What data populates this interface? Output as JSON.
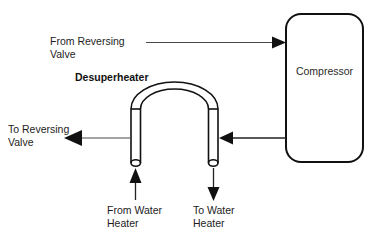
{
  "diagram": {
    "background_color": "#ffffff",
    "line_color": "#111111",
    "text_color": "#1d1d1d",
    "labels": {
      "desuperheater": "Desuperheater",
      "compressor": "Compressor",
      "from_reversing_valve_line1": "From Reversing",
      "from_reversing_valve_line2": "Valve",
      "to_reversing_valve_line1": "To Reversing",
      "to_reversing_valve_line2": "Valve",
      "from_water_heater_line1": "From Water",
      "from_water_heater_line2": "Heater",
      "to_water_heater_line1": "To Water",
      "to_water_heater_line2": "Heater"
    },
    "components": [
      {
        "id": "compressor",
        "name": "Compressor",
        "shape": "rounded-rectangle"
      },
      {
        "id": "desuperheater",
        "name": "Desuperheater",
        "shape": "inverted-u-tube"
      }
    ],
    "flows": [
      {
        "id": "from-reversing-valve",
        "label": "From Reversing Valve",
        "direction": "right",
        "target": "Compressor"
      },
      {
        "id": "compressor-to-desuperheater",
        "label": "",
        "direction": "left",
        "source": "Compressor",
        "target": "Desuperheater"
      },
      {
        "id": "to-reversing-valve",
        "label": "To Reversing Valve",
        "direction": "left",
        "source": "Desuperheater"
      },
      {
        "id": "from-water-heater",
        "label": "From Water Heater",
        "direction": "up",
        "target": "Desuperheater"
      },
      {
        "id": "to-water-heater",
        "label": "To Water Heater",
        "direction": "down",
        "source": "Desuperheater"
      }
    ]
  }
}
